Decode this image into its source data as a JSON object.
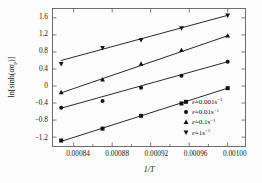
{
  "chart_data": {
    "type": "scatter",
    "title": "",
    "xlabel": "1/T",
    "ylabel": "ln[sinh(ασp)]",
    "xlim": [
      0.000818,
      0.0010185
    ],
    "ylim": [
      -1.42,
      1.82
    ],
    "xticks": [
      "0.00084",
      "0.00088",
      "0.00092",
      "0.00096",
      "0.00100"
    ],
    "xtick_values": [
      0.00084,
      0.00088,
      0.00092,
      0.00096,
      0.001
    ],
    "yticks": [
      "1.6",
      "1.2",
      "0.8",
      "0.4",
      "0",
      "-0.4",
      "-0.8",
      "-1.2"
    ],
    "ytick_values": [
      1.6,
      1.2,
      0.8,
      0.4,
      0,
      -0.4,
      -0.8,
      -1.2
    ],
    "grid": false,
    "legend_position": "bottom-right",
    "x": [
      0.000827,
      0.00087,
      0.00091,
      0.000952,
      0.001
    ],
    "series": [
      {
        "name": "e-dot = 0.001 s^-1",
        "marker": "square",
        "values": [
          -1.28,
          -1.0,
          -0.7,
          -0.41,
          -0.05
        ],
        "fit_start": [
          0.000827,
          -1.3
        ],
        "fit_end": [
          0.001,
          -0.05
        ]
      },
      {
        "name": "e-dot = 0.01 s^-1",
        "marker": "circle",
        "values": [
          -0.51,
          -0.35,
          -0.04,
          0.24,
          0.57
        ],
        "fit_start": [
          0.000827,
          -0.52
        ],
        "fit_end": [
          0.001,
          0.57
        ]
      },
      {
        "name": "e-dot = 0.1 s^-1",
        "marker": "triangle-up",
        "values": [
          -0.15,
          0.15,
          0.52,
          0.84,
          1.18
        ],
        "fit_start": [
          0.000827,
          -0.16
        ],
        "fit_end": [
          0.001,
          1.18
        ]
      },
      {
        "name": "e-dot = 1 s^-1",
        "marker": "triangle-down",
        "values": [
          0.52,
          0.9,
          1.08,
          1.36,
          1.66
        ],
        "fit_start": [
          0.000827,
          0.6
        ],
        "fit_end": [
          0.001,
          1.66
        ]
      }
    ]
  },
  "axes": {
    "x_title": "1/T",
    "y_title_prefix": "ln[sinh(",
    "y_title_alpha": "α",
    "y_title_sigma": "σ",
    "y_title_sub": "p",
    "y_title_suffix": ")]",
    "xtick_0": "0.00084",
    "xtick_1": "0.00088",
    "xtick_2": "0.00092",
    "xtick_3": "0.00096",
    "xtick_4": "0.00100",
    "ytick_0": "1.6",
    "ytick_1": "1.2",
    "ytick_2": "0.8",
    "ytick_3": "0.4",
    "ytick_4": "0",
    "ytick_5": "−0.4",
    "ytick_6": "−0.8",
    "ytick_7": "−1.2"
  },
  "legend": {
    "items": [
      {
        "symbol": "ε̇",
        "equals": "=0.001s",
        "exp": "−1",
        "marker": "square"
      },
      {
        "symbol": "ε̇",
        "equals": "=0.01s",
        "exp": "−1",
        "marker": "circle"
      },
      {
        "symbol": "ε̇",
        "equals": "=0.1s",
        "exp": "−1",
        "marker": "triangle-up"
      },
      {
        "symbol": "ε̇",
        "equals": "=1s",
        "exp": "−1",
        "marker": "triangle-down"
      }
    ]
  },
  "colors": {
    "ink": "#111111",
    "frame": "#4a4a4a",
    "background": "#fdfdfd"
  }
}
